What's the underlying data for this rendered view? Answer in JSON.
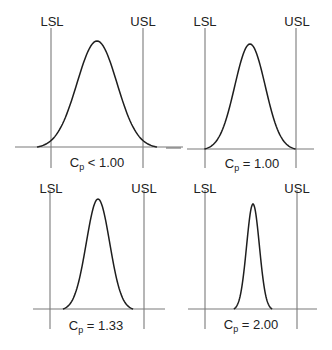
{
  "colors": {
    "background": "#ffffff",
    "curve": "#1e1e1e",
    "guide_lines": "#7a7a7a",
    "text": "#222222"
  },
  "chart_data": [
    {
      "type": "line",
      "title": "Cp < 1.00",
      "caption": {
        "main": "C",
        "sub": "p",
        "rest": " < 1.00"
      },
      "lsl_label": "LSL",
      "usl_label": "USL",
      "distribution": "normal",
      "relation": "process spread wider than specification limits",
      "geom": {
        "lsl_x": 51,
        "usl_x": 143,
        "baseline_y": 147,
        "line_top": 28,
        "line_bottom": 168,
        "base_x0": 15,
        "base_x1": 183,
        "center_x": 97,
        "peak_y": 41,
        "sigma_px": 20,
        "spread": 3,
        "lsl_label_x": 52,
        "usl_label_x": 143,
        "label_y": 26,
        "cap_x": 97,
        "cap_y": 167
      }
    },
    {
      "type": "line",
      "title": "Cp = 1.00",
      "caption": {
        "main": "C",
        "sub": "p",
        "rest": " = 1.00"
      },
      "lsl_label": "LSL",
      "usl_label": "USL",
      "distribution": "normal",
      "relation": "process spread equals specification width",
      "geom": {
        "lsl_x": 205,
        "usl_x": 296,
        "baseline_y": 149,
        "line_top": 28,
        "line_bottom": 168,
        "base_x0": 187,
        "base_x1": 314,
        "dash_x0": 166,
        "dash_x1": 181,
        "center_x": 250,
        "peak_y": 44,
        "sigma_px": 15.2,
        "spread": 3,
        "lsl_label_x": 205,
        "usl_label_x": 297,
        "label_y": 26,
        "cap_x": 252,
        "cap_y": 168
      }
    },
    {
      "type": "line",
      "title": "Cp = 1.33",
      "caption": {
        "main": "C",
        "sub": "p",
        "rest": " = 1.33"
      },
      "lsl_label": "LSL",
      "usl_label": "USL",
      "distribution": "normal",
      "relation": "process spread narrower than specification width",
      "geom": {
        "lsl_x": 50,
        "usl_x": 144,
        "baseline_y": 309,
        "line_top": 190,
        "line_bottom": 329,
        "base_x0": 33,
        "base_x1": 165,
        "center_x": 98,
        "peak_y": 199,
        "sigma_px": 11.7,
        "spread": 3,
        "lsl_label_x": 51,
        "usl_label_x": 144,
        "label_y": 193,
        "cap_x": 96,
        "cap_y": 330
      }
    },
    {
      "type": "line",
      "title": "Cp = 2.00",
      "caption": {
        "main": "C",
        "sub": "p",
        "rest": " = 2.00"
      },
      "lsl_label": "LSL",
      "usl_label": "USL",
      "distribution": "normal",
      "relation": "process spread half of specification width",
      "geom": {
        "lsl_x": 205,
        "usl_x": 297,
        "baseline_y": 309,
        "line_top": 190,
        "line_bottom": 329,
        "base_x0": 188,
        "base_x1": 317,
        "center_x": 253,
        "peak_y": 204,
        "sigma_px": 6.4,
        "spread": 3,
        "lsl_label_x": 205,
        "usl_label_x": 297,
        "label_y": 193,
        "cap_x": 251,
        "cap_y": 329
      }
    }
  ]
}
